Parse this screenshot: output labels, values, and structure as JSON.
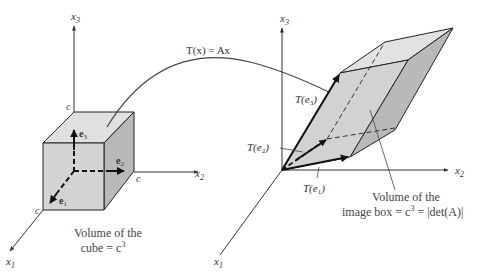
{
  "figure": {
    "transform_label": "T(x) = Ax",
    "left": {
      "axes": {
        "x1": "x",
        "x1_sub": "1",
        "x2": "x",
        "x2_sub": "2",
        "x3": "x",
        "x3_sub": "3"
      },
      "corner_labels": [
        "c",
        "c",
        "c"
      ],
      "vectors": [
        {
          "name": "e",
          "sub": "1"
        },
        {
          "name": "e",
          "sub": "2"
        },
        {
          "name": "e",
          "sub": "3"
        }
      ],
      "caption_line1": "Volume of the",
      "caption_line2": "cube = c",
      "caption_sup": "3"
    },
    "right": {
      "axes": {
        "x1": "x",
        "x1_sub": "1",
        "x2": "x",
        "x2_sub": "2",
        "x3": "x",
        "x3_sub": "3"
      },
      "vectors": [
        {
          "label": "T(e",
          "sub": "1",
          "close": ")"
        },
        {
          "label": "T(e",
          "sub": "2",
          "close": ")"
        },
        {
          "label": "T(e",
          "sub": "3",
          "close": ")"
        }
      ],
      "caption_line1": "Volume of the",
      "caption_line2": "image box = c",
      "caption_sup": "3",
      "caption_tail": " = |det(A)|"
    },
    "colors": {
      "face_front": "#d4d4d4",
      "face_top": "#e0e0e0",
      "face_side": "#b9b9b9",
      "stroke": "#222222",
      "axis": "#333333"
    }
  }
}
